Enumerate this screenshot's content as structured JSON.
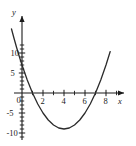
{
  "figure": {
    "name": "parabola-graph",
    "background_color": "#ffffff",
    "curve_color": "#2b2b2b",
    "axis_color": "#1a1a1a"
  },
  "axis_names": {
    "x": "x",
    "y": "y"
  },
  "labels": {
    "x_ticks": [
      {
        "value": 2,
        "text": "2"
      },
      {
        "value": 4,
        "text": "4"
      },
      {
        "value": 6,
        "text": "6"
      },
      {
        "value": 8,
        "text": "8"
      }
    ],
    "y_ticks": [
      {
        "value": 10,
        "text": "10"
      },
      {
        "value": 5,
        "text": "5"
      },
      {
        "value": -5,
        "text": "-5"
      },
      {
        "value": -10,
        "text": "-10"
      }
    ],
    "origin": "0"
  },
  "chart_data": {
    "type": "line",
    "title": "",
    "xlabel": "x",
    "ylabel": "y",
    "xlim": [
      -1.2,
      8.8
    ],
    "ylim": [
      -11.5,
      13.5
    ],
    "grid": false,
    "legend": "none",
    "x_tick_values": [
      2,
      4,
      6,
      8
    ],
    "y_tick_values": [
      10,
      5,
      -5,
      -10
    ],
    "x_minor_tick_step": 1,
    "y_minor_tick_step": 1,
    "series": [
      {
        "name": "y = x^2 - 8x + 7",
        "equation": "y = x^2 - 8x + 7",
        "vertex": [
          4,
          -9
        ],
        "x_intercepts": [
          1,
          7
        ],
        "y_intercept": 7,
        "x": [
          -1.0,
          -0.75,
          -0.5,
          -0.25,
          0.0,
          0.5,
          1.0,
          1.5,
          2.0,
          2.5,
          3.0,
          3.5,
          4.0,
          4.5,
          5.0,
          5.5,
          6.0,
          6.5,
          7.0,
          7.5,
          8.0,
          8.4
        ],
        "values": [
          16.0,
          13.5625,
          11.25,
          9.0625,
          7.0,
          3.25,
          0.0,
          -2.75,
          -5.0,
          -6.75,
          -8.0,
          -8.75,
          -9.0,
          -8.75,
          -8.0,
          -6.75,
          -5.0,
          -2.75,
          0.0,
          3.25,
          7.0,
          10.36
        ]
      }
    ]
  }
}
